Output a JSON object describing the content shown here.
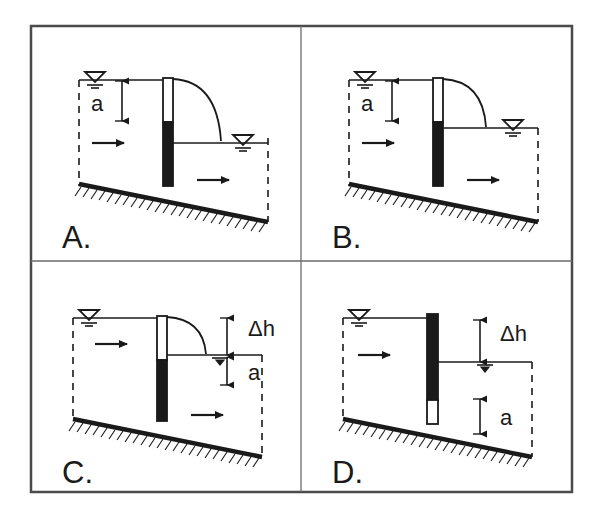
{
  "figure": {
    "title": "",
    "background_color": "#ffffff",
    "line_color": "#1a1a1a",
    "fill_color": "#1a1a1a",
    "panel_count": 4,
    "layout": "2x2-grid"
  },
  "panels": [
    {
      "id": "A",
      "label": "A.",
      "gate_type": "overflow-gate",
      "gate_upper_state": "open-white",
      "gate_lower_state": "closed-black",
      "nappe_visible": true,
      "nappe_lands": "below-downstream-surface",
      "downstream_level": "low",
      "dimensions": [
        {
          "name": "a",
          "label": "a",
          "measures": "upstream-head-above-gate-crest"
        }
      ],
      "flow_arrows": [
        "upstream",
        "downstream"
      ],
      "water_marks": [
        "upstream-surface",
        "downstream-surface"
      ]
    },
    {
      "id": "B",
      "label": "B.",
      "gate_type": "overflow-gate",
      "gate_upper_state": "open-white",
      "gate_lower_state": "closed-black",
      "nappe_visible": true,
      "nappe_lands": "at-downstream-surface",
      "downstream_level": "high",
      "dimensions": [
        {
          "name": "a",
          "label": "a",
          "measures": "upstream-head-above-gate-crest"
        }
      ],
      "flow_arrows": [
        "upstream",
        "downstream"
      ],
      "water_marks": [
        "upstream-surface",
        "downstream-surface"
      ]
    },
    {
      "id": "C",
      "label": "C.",
      "gate_type": "overflow-gate",
      "gate_upper_state": "open-white",
      "gate_lower_state": "closed-black",
      "nappe_visible": true,
      "nappe_lands": "at-downstream-surface",
      "downstream_level": "high",
      "dimensions": [
        {
          "name": "dh",
          "label": "Δh",
          "measures": "head-drop-across-gate"
        },
        {
          "name": "a",
          "label": "a",
          "measures": "depth-below-downstream-surface"
        }
      ],
      "flow_arrows": [
        "upstream",
        "downstream"
      ],
      "water_marks": [
        "upstream-surface",
        "downstream-surface"
      ]
    },
    {
      "id": "D",
      "label": "D.",
      "gate_type": "underflow-gate",
      "gate_upper_state": "closed-black",
      "gate_lower_state": "open-white",
      "nappe_visible": false,
      "nappe_lands": "",
      "downstream_level": "high",
      "dimensions": [
        {
          "name": "dh",
          "label": "Δh",
          "measures": "head-drop-across-gate"
        },
        {
          "name": "a",
          "label": "a",
          "measures": "gate-opening-height"
        }
      ],
      "flow_arrows": [
        "upstream"
      ],
      "water_marks": [
        "upstream-surface",
        "downstream-surface"
      ]
    }
  ]
}
